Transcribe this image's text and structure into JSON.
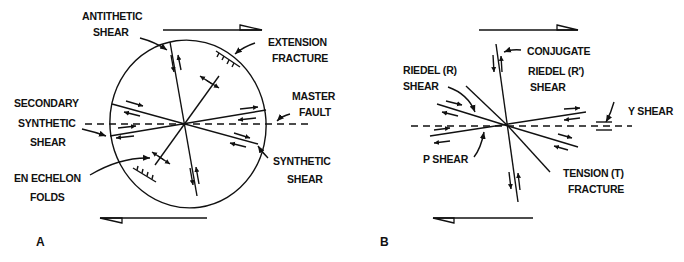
{
  "figure": {
    "panel_a": {
      "label": "A",
      "labels": {
        "antithetic_shear": [
          "ANTITHETIC",
          "SHEAR"
        ],
        "extension_fracture": [
          "EXTENSION",
          "FRACTURE"
        ],
        "master_fault": [
          "MASTER",
          "FAULT"
        ],
        "secondary_synthetic_shear": [
          "SECONDARY",
          "SYNTHETIC",
          "SHEAR"
        ],
        "synthetic_shear": [
          "SYNTHETIC",
          "SHEAR"
        ],
        "en_echelon_folds": [
          "EN ECHELON",
          "FOLDS"
        ]
      }
    },
    "panel_b": {
      "label": "B",
      "labels": {
        "riedel_shear": [
          "RIEDEL (R)",
          "SHEAR"
        ],
        "conjugate_riedel_shear": [
          "CONJUGATE",
          "RIEDEL (R′)",
          "SHEAR"
        ],
        "y_shear": [
          "Y SHEAR"
        ],
        "p_shear": [
          "P SHEAR"
        ],
        "tension_fracture": [
          "TENSION (T)",
          "FRACTURE"
        ]
      }
    },
    "colors": {
      "ink": "#111111",
      "background": "#ffffff"
    }
  }
}
